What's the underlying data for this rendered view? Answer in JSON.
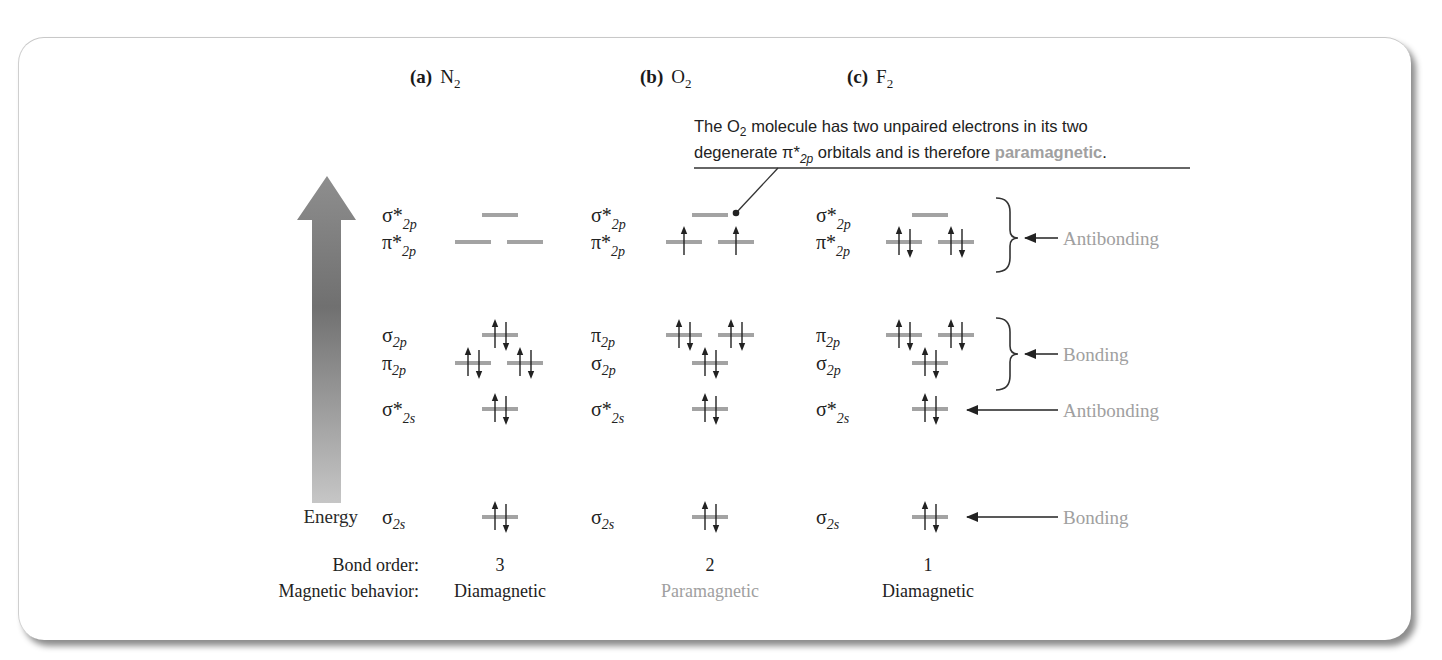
{
  "headers": [
    {
      "tag": "(a)",
      "molecule": "N",
      "sub": "2",
      "x": 410
    },
    {
      "tag": "(b)",
      "molecule": "O",
      "sub": "2",
      "x": 640
    },
    {
      "tag": "(c)",
      "molecule": "F",
      "sub": "2",
      "x": 847
    }
  ],
  "callout": {
    "line1_pre": "The O",
    "line1_sub": "2",
    "line1_post": " molecule has two unpaired electrons in its two",
    "line2_pre": "degenerate π*",
    "line2_sub": "2p",
    "line2_post": " orbitals and is therefore ",
    "line2_highlight": "paramagnetic",
    "line2_end": "."
  },
  "energy_axis": {
    "label": "Energy"
  },
  "columns": [
    {
      "id": "N2",
      "label_x": 382,
      "levels": [
        {
          "name": "σ*",
          "sub": "2p",
          "y": 215,
          "orbitals": [
            {
              "x": 500,
              "up": false,
              "down": false
            }
          ]
        },
        {
          "name": "π*",
          "sub": "2p",
          "y": 242,
          "orbitals": [
            {
              "x": 473,
              "up": false,
              "down": false
            },
            {
              "x": 525,
              "up": false,
              "down": false
            }
          ]
        },
        {
          "name": "σ",
          "sub": "2p",
          "y": 335,
          "orbitals": [
            {
              "x": 500,
              "up": true,
              "down": true
            }
          ]
        },
        {
          "name": "π",
          "sub": "2p",
          "y": 363,
          "orbitals": [
            {
              "x": 473,
              "up": true,
              "down": true
            },
            {
              "x": 525,
              "up": true,
              "down": true
            }
          ]
        },
        {
          "name": "σ*",
          "sub": "2s",
          "y": 409,
          "orbitals": [
            {
              "x": 500,
              "up": true,
              "down": true
            }
          ]
        },
        {
          "name": "σ",
          "sub": "2s",
          "y": 517,
          "orbitals": [
            {
              "x": 500,
              "up": true,
              "down": true
            }
          ]
        }
      ],
      "bond_order": "3",
      "magnetic": "Diamagnetic",
      "magnetic_highlight": false,
      "center_x": 500
    },
    {
      "id": "O2",
      "label_x": 591,
      "levels": [
        {
          "name": "σ*",
          "sub": "2p",
          "y": 215,
          "orbitals": [
            {
              "x": 710,
              "up": false,
              "down": false
            }
          ]
        },
        {
          "name": "π*",
          "sub": "2p",
          "y": 242,
          "orbitals": [
            {
              "x": 684,
              "up": true,
              "down": false
            },
            {
              "x": 736,
              "up": true,
              "down": false
            }
          ]
        },
        {
          "name": "π",
          "sub": "2p",
          "y": 335,
          "orbitals": [
            {
              "x": 684,
              "up": true,
              "down": true
            },
            {
              "x": 736,
              "up": true,
              "down": true
            }
          ]
        },
        {
          "name": "σ",
          "sub": "2p",
          "y": 363,
          "orbitals": [
            {
              "x": 710,
              "up": true,
              "down": true
            }
          ]
        },
        {
          "name": "σ*",
          "sub": "2s",
          "y": 409,
          "orbitals": [
            {
              "x": 710,
              "up": true,
              "down": true
            }
          ]
        },
        {
          "name": "σ",
          "sub": "2s",
          "y": 517,
          "orbitals": [
            {
              "x": 710,
              "up": true,
              "down": true
            }
          ]
        }
      ],
      "bond_order": "2",
      "magnetic": "Paramagnetic",
      "magnetic_highlight": true,
      "center_x": 710
    },
    {
      "id": "F2",
      "label_x": 816,
      "levels": [
        {
          "name": "σ*",
          "sub": "2p",
          "y": 215,
          "orbitals": [
            {
              "x": 930,
              "up": false,
              "down": false
            }
          ]
        },
        {
          "name": "π*",
          "sub": "2p",
          "y": 242,
          "orbitals": [
            {
              "x": 904,
              "up": true,
              "down": true
            },
            {
              "x": 956,
              "up": true,
              "down": true
            }
          ]
        },
        {
          "name": "π",
          "sub": "2p",
          "y": 335,
          "orbitals": [
            {
              "x": 904,
              "up": true,
              "down": true
            },
            {
              "x": 956,
              "up": true,
              "down": true
            }
          ]
        },
        {
          "name": "σ",
          "sub": "2p",
          "y": 363,
          "orbitals": [
            {
              "x": 930,
              "up": true,
              "down": true
            }
          ]
        },
        {
          "name": "σ*",
          "sub": "2s",
          "y": 409,
          "orbitals": [
            {
              "x": 930,
              "up": true,
              "down": true
            }
          ]
        },
        {
          "name": "σ",
          "sub": "2s",
          "y": 517,
          "orbitals": [
            {
              "x": 930,
              "up": true,
              "down": true
            }
          ]
        }
      ],
      "bond_order": "1",
      "magnetic": "Diamagnetic",
      "magnetic_highlight": false,
      "center_x": 930
    }
  ],
  "annotations": [
    {
      "label": "Antibonding",
      "type": "brace",
      "y_top": 198,
      "y_bot": 272,
      "y_mid": 238
    },
    {
      "label": "Bonding",
      "type": "brace",
      "y_top": 318,
      "y_bot": 390,
      "y_mid": 354
    },
    {
      "label": "Antibonding",
      "type": "arrow",
      "y_mid": 410
    },
    {
      "label": "Bonding",
      "type": "arrow",
      "y_mid": 517
    }
  ],
  "rows": {
    "bond_order_label": "Bond order:",
    "magnetic_label": "Magnetic behavior:"
  },
  "colors": {
    "level": "#a3a3a3",
    "highlight": "#a0a0a0",
    "text": "#222222",
    "arrow_top": "#8a8a8a",
    "arrow_mid": "#6f6f6f",
    "arrow_bottom": "#c4c4c4"
  }
}
